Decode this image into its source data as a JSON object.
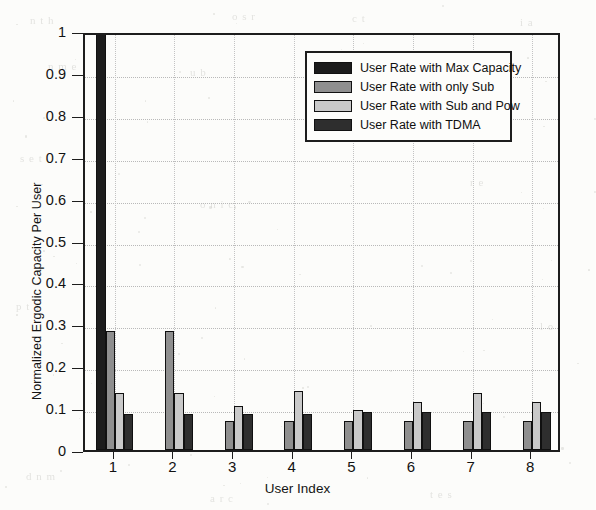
{
  "chart_data": {
    "type": "bar",
    "title": "",
    "xlabel": "User Index",
    "ylabel": "Normalized Ergodic Capacity Per User",
    "categories": [
      "1",
      "2",
      "3",
      "4",
      "5",
      "6",
      "7",
      "8"
    ],
    "xlim": [
      0.5,
      8.5
    ],
    "ylim": [
      0,
      1
    ],
    "ytick_labels": [
      "0",
      "0.1",
      "0.2",
      "0.3",
      "0.4",
      "0.5",
      "0.6",
      "0.7",
      "0.8",
      "0.9",
      "1"
    ],
    "ytick_values": [
      0,
      0.1,
      0.2,
      0.3,
      0.4,
      0.5,
      0.6,
      0.7,
      0.8,
      0.9,
      1
    ],
    "grid": true,
    "legend_position": "top-right-inside",
    "series": [
      {
        "name": "User Rate with Max Capacity",
        "color": "#1c1c1c",
        "values": [
          1.0,
          0,
          0,
          0,
          0,
          0,
          0,
          0
        ]
      },
      {
        "name": "User Rate with only Sub",
        "color": "#8f8f8f",
        "values": [
          0.285,
          0.285,
          0.07,
          0.07,
          0.07,
          0.07,
          0.07,
          0.07
        ]
      },
      {
        "name": "User Rate with Sub and Pow",
        "color": "#c9c9c9",
        "values": [
          0.135,
          0.135,
          0.105,
          0.14,
          0.095,
          0.115,
          0.135,
          0.115
        ]
      },
      {
        "name": "User Rate with TDMA",
        "color": "#2e2e2e",
        "values": [
          0.085,
          0.085,
          0.085,
          0.085,
          0.09,
          0.09,
          0.09,
          0.09
        ]
      }
    ]
  },
  "legend": {
    "entries": [
      {
        "label": "User Rate with Max Capacity",
        "color": "#1c1c1c"
      },
      {
        "label": "User Rate with only Sub",
        "color": "#8f8f8f"
      },
      {
        "label": "User Rate with Sub and Pow",
        "color": "#c9c9c9"
      },
      {
        "label": "User Rate with TDMA",
        "color": "#2e2e2e"
      }
    ]
  },
  "scan_artifacts": {
    "ghost_texts": [
      {
        "text": "n  t  h",
        "x": 30,
        "y": 14
      },
      {
        "text": "o   s  r",
        "x": 232,
        "y": 10
      },
      {
        "text": "c   t",
        "x": 352,
        "y": 12
      },
      {
        "text": "i  a",
        "x": 520,
        "y": 16
      },
      {
        "text": "n   m   e",
        "x": 48,
        "y": 60
      },
      {
        "text": "u  b",
        "x": 190,
        "y": 66
      },
      {
        "text": "h   o   r",
        "x": 420,
        "y": 62
      },
      {
        "text": "s   e  t",
        "x": 20,
        "y": 152
      },
      {
        "text": "o  n  i  c",
        "x": 200,
        "y": 198
      },
      {
        "text": "r  e",
        "x": 470,
        "y": 176
      },
      {
        "text": "p   t   a",
        "x": 16,
        "y": 300
      },
      {
        "text": "l   o",
        "x": 540,
        "y": 320
      },
      {
        "text": "d   n   m",
        "x": 26,
        "y": 470
      },
      {
        "text": "a  r   c",
        "x": 210,
        "y": 492
      },
      {
        "text": "t   e   s",
        "x": 430,
        "y": 488
      }
    ]
  }
}
